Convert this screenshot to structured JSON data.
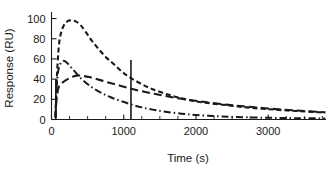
{
  "figure": {
    "background": "#ffffff",
    "ink_color": "#1a1a1a"
  },
  "chart_data": {
    "type": "line",
    "title": "",
    "xlabel": "Time (s)",
    "ylabel": "Response (RU)",
    "xlim": [
      0,
      3800
    ],
    "ylim": [
      0,
      105
    ],
    "xticks": [
      0,
      1000,
      2000,
      3000
    ],
    "xtick_labels": [
      "0",
      "1000",
      "2000",
      "3000"
    ],
    "xticks_minor": [
      250,
      500,
      750,
      1250,
      1500,
      1750,
      2250,
      2500,
      2750,
      3250,
      3500,
      3750
    ],
    "yticks": [
      0,
      20,
      40,
      60,
      80,
      100
    ],
    "ytick_labels": [
      "0",
      "20",
      "40",
      "60",
      "80",
      "100"
    ],
    "grid": false,
    "legend": false,
    "legend_position": "none",
    "annotations": [
      {
        "name": "injection-start-marker",
        "type": "vline",
        "x": 60,
        "y_top": 40,
        "style": "solid"
      },
      {
        "name": "injection-end-marker",
        "type": "vline",
        "x": 1100,
        "y_top": 59,
        "style": "solid"
      }
    ],
    "series": [
      {
        "name": "high-concentration",
        "style": "short-dash",
        "dasharray": "5 3",
        "x": [
          55,
          70,
          90,
          110,
          140,
          170,
          200,
          240,
          290,
          340,
          380,
          430,
          500,
          570,
          650,
          750,
          860,
          980,
          1100,
          1250,
          1400,
          1600,
          1800,
          2000,
          2200,
          2450,
          2700,
          2950,
          3200,
          3450,
          3700,
          3790
        ],
        "y": [
          3,
          35,
          62,
          78,
          88,
          93,
          96,
          98,
          98,
          97,
          95,
          91,
          84,
          77,
          70,
          62,
          55,
          47,
          41,
          35,
          30,
          25,
          21,
          18,
          16,
          14,
          12,
          10.5,
          9.2,
          8.2,
          7.2,
          7.0
        ]
      },
      {
        "name": "mid-concentration",
        "style": "long-dash",
        "dasharray": "8 4",
        "x": [
          55,
          70,
          95,
          125,
          160,
          200,
          250,
          300,
          350,
          400,
          450,
          520,
          600,
          700,
          820,
          950,
          1100,
          1250,
          1420,
          1600,
          1800,
          2000,
          2200,
          2450,
          2700,
          2950,
          3200,
          3450,
          3700,
          3790
        ],
        "y": [
          2,
          20,
          31,
          35,
          37,
          39,
          41,
          42.5,
          43.5,
          43.5,
          43,
          42,
          40.5,
          38.5,
          36,
          33.5,
          30.5,
          28,
          25.5,
          23,
          20.5,
          18.5,
          16.5,
          14.5,
          12.8,
          11.2,
          9.8,
          8.6,
          7.5,
          7.2
        ]
      },
      {
        "name": "low-concentration",
        "style": "dash-dot",
        "dasharray": "7 3 1.5 3",
        "x": [
          55,
          68,
          85,
          105,
          130,
          160,
          190,
          230,
          280,
          330,
          390,
          450,
          520,
          600,
          700,
          820,
          950,
          1100,
          1250,
          1420,
          1600,
          1800,
          2000,
          2250,
          2500,
          2800,
          3100,
          3400,
          3700,
          3790
        ],
        "y": [
          2,
          28,
          44,
          52,
          56,
          58,
          57.5,
          55,
          51,
          47,
          42,
          38,
          34,
          30,
          26,
          22,
          18.5,
          15,
          12,
          9.5,
          7.5,
          5.8,
          4.5,
          3.4,
          2.6,
          2.0,
          1.6,
          1.3,
          1.1,
          1.0
        ]
      }
    ]
  }
}
